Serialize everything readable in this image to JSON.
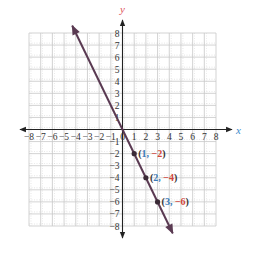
{
  "chart_data": {
    "type": "line",
    "title": "",
    "xlabel": "x",
    "ylabel": "y",
    "xlim": [
      -8,
      8
    ],
    "ylim": [
      -8,
      8
    ],
    "grid": true,
    "x_ticks": [
      -8,
      -7,
      -6,
      -5,
      -4,
      -3,
      -2,
      -1,
      0,
      1,
      2,
      3,
      4,
      5,
      6,
      7,
      8
    ],
    "y_ticks": [
      -8,
      -7,
      -6,
      -5,
      -4,
      -3,
      -2,
      -1,
      1,
      2,
      3,
      4,
      5,
      6,
      7,
      8
    ],
    "x_tick_labels": [
      "−8",
      "−7",
      "−6",
      "−5",
      "−4",
      "−3",
      "−2",
      "−1",
      "0",
      "1",
      "2",
      "3",
      "4",
      "5",
      "6",
      "7",
      "8"
    ],
    "y_tick_labels": [
      "−8",
      "−7",
      "−6",
      "−5",
      "−4",
      "−3",
      "−2",
      "−1",
      "1",
      "2",
      "3",
      "4",
      "5",
      "6",
      "7",
      "8"
    ],
    "series": [
      {
        "name": "y = -2x",
        "equation": "y = -2x",
        "slope": -2,
        "intercept": 0,
        "x_range": [
          -4.3,
          4.3
        ],
        "arrows": "both"
      }
    ],
    "points": [
      {
        "x": 1,
        "y": -2,
        "label_x": "1",
        "label_y": "−2"
      },
      {
        "x": 2,
        "y": -4,
        "label_x": "2",
        "label_y": "−4"
      },
      {
        "x": 3,
        "y": -6,
        "label_x": "3",
        "label_y": "−6"
      }
    ]
  },
  "colors": {
    "line": "#5a3a52",
    "point": "#3a2a36",
    "axis": "#222222",
    "grid": "#c8c8c8",
    "x_coord_label": "#3a7ab8",
    "y_coord_label": "#d2453a",
    "x_axis_label": "#3a8acb",
    "y_axis_label": "#e0525a",
    "tick_label": "#333333"
  },
  "axis_labels": {
    "x": "x",
    "y": "y"
  }
}
